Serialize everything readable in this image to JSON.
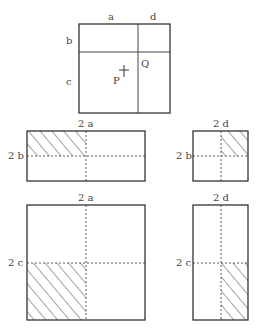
{
  "top_figure": {
    "labels": {
      "a": "a",
      "d": "d",
      "b": "b",
      "c": "c",
      "P": "P",
      "Q": "Q"
    }
  },
  "middle_left": {
    "top_label": "2 a",
    "side_label": "2 b"
  },
  "middle_right": {
    "top_label": "2 d",
    "side_label": "2 b"
  },
  "bottom_left": {
    "top_label": "2 a",
    "side_label": "2 c"
  },
  "bottom_right": {
    "top_label": "2 d",
    "side_label": "2 c"
  },
  "colors": {
    "stroke": "#333333",
    "text": "#444444"
  }
}
